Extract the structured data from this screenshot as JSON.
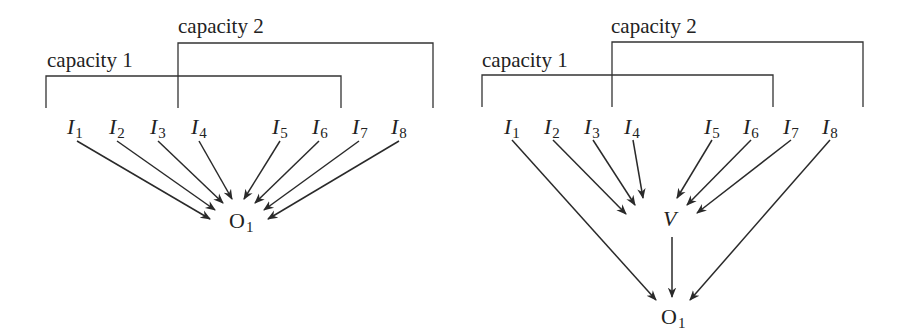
{
  "diagrams": [
    {
      "id": "left",
      "capacity1": {
        "label": "capacity 1"
      },
      "capacity2": {
        "label": "capacity 2"
      },
      "inputs": [
        {
          "name": "I",
          "sub": "1"
        },
        {
          "name": "I",
          "sub": "2"
        },
        {
          "name": "I",
          "sub": "3"
        },
        {
          "name": "I",
          "sub": "4"
        },
        {
          "name": "I",
          "sub": "5"
        },
        {
          "name": "I",
          "sub": "6"
        },
        {
          "name": "I",
          "sub": "7"
        },
        {
          "name": "I",
          "sub": "8"
        }
      ],
      "output": {
        "name": "O",
        "sub": "1"
      },
      "edges": "all inputs I1–I8 connect directly to O1"
    },
    {
      "id": "right",
      "capacity1": {
        "label": "capacity 1"
      },
      "capacity2": {
        "label": "capacity 2"
      },
      "inputs": [
        {
          "name": "I",
          "sub": "1"
        },
        {
          "name": "I",
          "sub": "2"
        },
        {
          "name": "I",
          "sub": "3"
        },
        {
          "name": "I",
          "sub": "4"
        },
        {
          "name": "I",
          "sub": "5"
        },
        {
          "name": "I",
          "sub": "6"
        },
        {
          "name": "I",
          "sub": "7"
        },
        {
          "name": "I",
          "sub": "8"
        }
      ],
      "hidden": {
        "name": "V"
      },
      "output": {
        "name": "O",
        "sub": "1"
      },
      "edges": "I2–I7 connect to V; V, I1 and I8 connect to O1"
    }
  ]
}
